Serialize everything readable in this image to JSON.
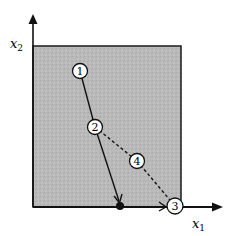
{
  "diagram": {
    "type": "feasible-region-path",
    "axes": {
      "x_label": "x",
      "x_sub": "1",
      "y_label": "x",
      "y_sub": "2"
    },
    "region": {
      "fill": "#b8b8b8",
      "stroke": "#1a1a1a"
    },
    "nodes": [
      {
        "id": "1",
        "label": "1",
        "x": 80,
        "y": 71
      },
      {
        "id": "2",
        "label": "2",
        "x": 95,
        "y": 127
      },
      {
        "id": "3",
        "label": "3",
        "x": 175,
        "y": 206
      },
      {
        "id": "4",
        "label": "4",
        "x": 137,
        "y": 161
      }
    ],
    "solid_path": [
      "1",
      "2",
      "boundary-point"
    ],
    "dashed_path": [
      "2",
      "4",
      "3"
    ],
    "boundary_point": {
      "x": 120,
      "y": 206
    },
    "boundary_arrow": {
      "from": "boundary-point",
      "to": "3"
    },
    "colors": {
      "line": "#111111",
      "node_fill": "#ffffff",
      "background": "#ffffff"
    }
  }
}
